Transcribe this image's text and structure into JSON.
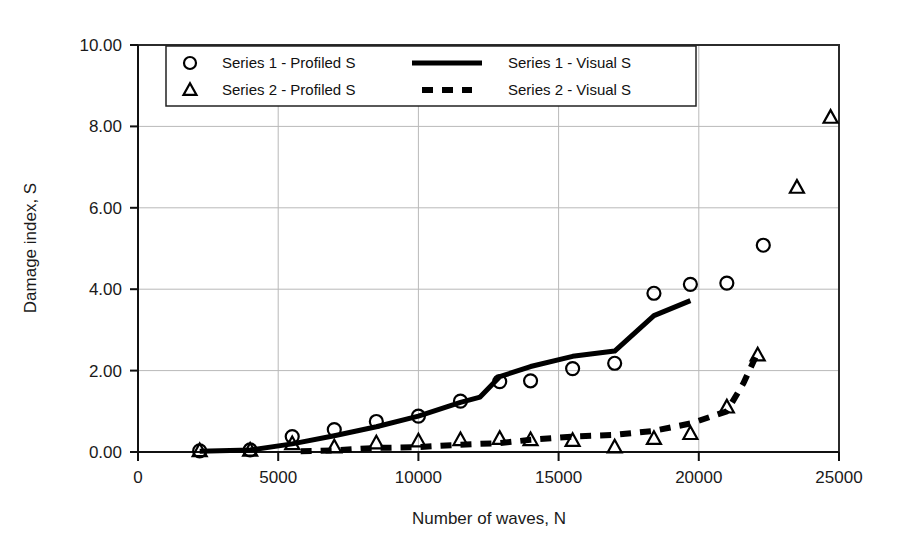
{
  "chart_data": {
    "type": "scatter",
    "title": "",
    "xlabel": "Number of waves, N",
    "ylabel": "Damage index, S",
    "xlim": [
      0,
      25000
    ],
    "ylim": [
      0,
      10
    ],
    "xticks": [
      0,
      5000,
      10000,
      15000,
      20000,
      25000
    ],
    "xtick_labels": [
      "0",
      "5000",
      "10000",
      "15000",
      "20000",
      "25000"
    ],
    "yticks": [
      0,
      2,
      4,
      6,
      8,
      10
    ],
    "ytick_labels": [
      "0.00",
      "2.00",
      "4.00",
      "6.00",
      "8.00",
      "10.00"
    ],
    "grid": true,
    "legend_position": "upper-left-inside",
    "series": [
      {
        "name": "Series 1 - Profiled S",
        "marker": "circle",
        "style": "markers",
        "points": [
          [
            2200,
            0.03
          ],
          [
            4000,
            0.05
          ],
          [
            5500,
            0.38
          ],
          [
            7000,
            0.55
          ],
          [
            8500,
            0.75
          ],
          [
            10000,
            0.88
          ],
          [
            11500,
            1.25
          ],
          [
            12900,
            1.73
          ],
          [
            14000,
            1.75
          ],
          [
            15500,
            2.05
          ],
          [
            17000,
            2.18
          ],
          [
            18400,
            3.9
          ],
          [
            19700,
            4.12
          ],
          [
            21000,
            4.15
          ],
          [
            22300,
            5.08
          ]
        ]
      },
      {
        "name": "Series 2 - Profiled S",
        "marker": "triangle",
        "style": "markers",
        "points": [
          [
            2200,
            0.03
          ],
          [
            4000,
            0.04
          ],
          [
            5500,
            0.2
          ],
          [
            7000,
            0.12
          ],
          [
            8500,
            0.22
          ],
          [
            10000,
            0.27
          ],
          [
            11500,
            0.3
          ],
          [
            12900,
            0.33
          ],
          [
            14000,
            0.3
          ],
          [
            15500,
            0.28
          ],
          [
            17000,
            0.12
          ],
          [
            18400,
            0.33
          ],
          [
            19700,
            0.45
          ],
          [
            21000,
            1.1
          ],
          [
            22100,
            2.38
          ],
          [
            23500,
            6.5
          ],
          [
            24700,
            8.22
          ]
        ]
      },
      {
        "name": "Series 1 - Visual S",
        "marker": "none",
        "style": "solid-line",
        "points": [
          [
            2200,
            0.02
          ],
          [
            4000,
            0.05
          ],
          [
            5500,
            0.2
          ],
          [
            7000,
            0.4
          ],
          [
            8500,
            0.62
          ],
          [
            10000,
            0.88
          ],
          [
            11500,
            1.22
          ],
          [
            12200,
            1.35
          ],
          [
            12900,
            1.85
          ],
          [
            14000,
            2.1
          ],
          [
            15500,
            2.35
          ],
          [
            17000,
            2.48
          ],
          [
            18400,
            3.35
          ],
          [
            19700,
            3.72
          ]
        ]
      },
      {
        "name": "Series 2 - Visual S",
        "marker": "none",
        "style": "dashed-line",
        "points": [
          [
            5800,
            0.02
          ],
          [
            7000,
            0.04
          ],
          [
            8500,
            0.1
          ],
          [
            10000,
            0.12
          ],
          [
            11500,
            0.18
          ],
          [
            12900,
            0.22
          ],
          [
            14000,
            0.3
          ],
          [
            15500,
            0.38
          ],
          [
            17000,
            0.42
          ],
          [
            18400,
            0.52
          ],
          [
            19700,
            0.7
          ],
          [
            21000,
            1.0
          ],
          [
            21600,
            1.7
          ],
          [
            22100,
            2.45
          ]
        ]
      }
    ],
    "legend_entries": [
      {
        "label": "Series 1 - Profiled S",
        "symbol": "circle"
      },
      {
        "label": "Series 1 - Visual S",
        "symbol": "solid-line"
      },
      {
        "label": "Series 2 - Profiled S",
        "symbol": "triangle"
      },
      {
        "label": "Series 2 - Visual S",
        "symbol": "dashed-line"
      }
    ]
  }
}
